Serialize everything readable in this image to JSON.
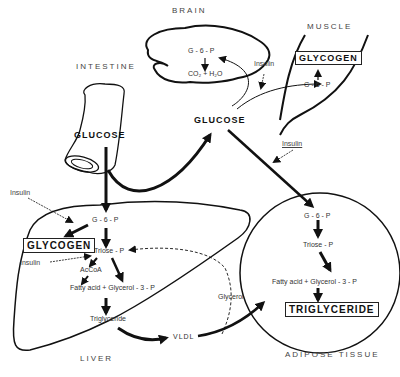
{
  "regions": {
    "brain": "BRAIN",
    "muscle": "MUSCLE",
    "intestine": "INTESTINE",
    "liver": "LIVER",
    "adipose": "ADIPOSE TISSUE"
  },
  "brain": {
    "g6p": "G - 6 - P",
    "co2_h2o": "CO₂ + H₂O"
  },
  "muscle": {
    "glycogen": "GLYCOGEN",
    "g6p": "G - 6 - P",
    "insulin": "Insulin"
  },
  "intestine": {
    "glucose": "GLUCOSE"
  },
  "blood": {
    "glucose": "GLUCOSE",
    "insulin_adipose": "Insulin"
  },
  "liver": {
    "insulin_top": "Insulin",
    "g6p": "G - 6 - P",
    "glycogen": "GLYCOGEN",
    "triose_p": "Triose - P",
    "insulin_bottom": "Insulin",
    "accoa": "AcCoA",
    "fatty_acid_glycerol3p": "Fatty acid  +  Glycerol - 3 - P",
    "triglyceride": "Triglyceride",
    "vldl": "VLDL",
    "glycerol": "Glycerol"
  },
  "adipose": {
    "g6p": "G - 6 - P",
    "triose_p": "Triose - P",
    "fatty_acid_glycerol3p": "Fatty acid  +  Glycerol - 3 - P",
    "triglyceride": "TRIGLYCERIDE"
  }
}
